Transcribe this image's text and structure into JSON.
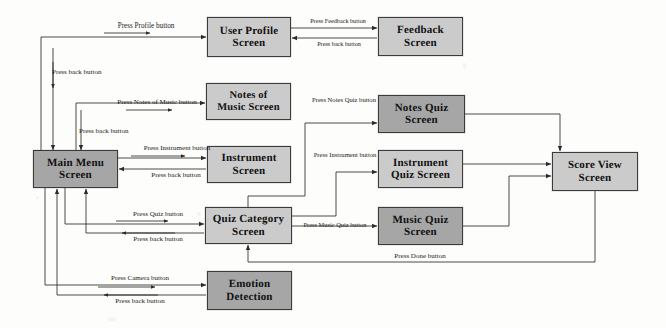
{
  "diagram": {
    "type": "flowchart",
    "canvas": {
      "width": 666,
      "height": 328
    },
    "colors": {
      "node_fill_light": "#cbcbcb",
      "node_fill_dark": "#a6a6a6",
      "node_border": "#3b3b3b",
      "arrow": "#2b2b2b",
      "background": "#fdfdfb",
      "text": "#111111"
    },
    "nodes": [
      {
        "id": "user_profile",
        "label_line1": "User Profile",
        "label_line2": "Screen",
        "x": 207,
        "y": 17,
        "w": 84,
        "h": 40,
        "fill": "light",
        "font_size": 11
      },
      {
        "id": "feedback",
        "label_line1": "Feedback",
        "label_line2": "Screen",
        "x": 378,
        "y": 17,
        "w": 85,
        "h": 39,
        "fill": "light",
        "font_size": 11
      },
      {
        "id": "notes_music",
        "label_line1": "Notes of",
        "label_line2": "Music Screen",
        "x": 206,
        "y": 83,
        "w": 85,
        "h": 37,
        "fill": "light",
        "font_size": 10.5
      },
      {
        "id": "notes_quiz",
        "label_line1": "Notes Quiz",
        "label_line2": "Screen",
        "x": 378,
        "y": 95,
        "w": 87,
        "h": 38,
        "fill": "dark",
        "font_size": 11
      },
      {
        "id": "main_menu",
        "label_line1": "Main Menu",
        "label_line2": "Screen",
        "x": 33,
        "y": 150,
        "w": 85,
        "h": 38,
        "fill": "dark",
        "font_size": 11
      },
      {
        "id": "instrument",
        "label_line1": "Instrument",
        "label_line2": "Screen",
        "x": 207,
        "y": 146,
        "w": 84,
        "h": 37,
        "fill": "light",
        "font_size": 11
      },
      {
        "id": "instrument_quiz",
        "label_line1": "Instrument",
        "label_line2": "Quiz Screen",
        "x": 378,
        "y": 150,
        "w": 85,
        "h": 38,
        "fill": "light",
        "font_size": 11
      },
      {
        "id": "score_view",
        "label_line1": "Score View",
        "label_line2": "Screen",
        "x": 552,
        "y": 152,
        "w": 86,
        "h": 39,
        "fill": "light",
        "font_size": 11
      },
      {
        "id": "quiz_category",
        "label_line1": "Quiz Category",
        "label_line2": "Screen",
        "x": 205,
        "y": 207,
        "w": 87,
        "h": 37,
        "fill": "light",
        "font_size": 11
      },
      {
        "id": "music_quiz",
        "label_line1": "Music Quiz",
        "label_line2": "Screen",
        "x": 378,
        "y": 207,
        "w": 85,
        "h": 38,
        "fill": "dark",
        "font_size": 11
      },
      {
        "id": "emotion",
        "label_line1": "Emotion",
        "label_line2": "Detection",
        "x": 207,
        "y": 271,
        "w": 85,
        "h": 39,
        "fill": "dark",
        "font_size": 11
      }
    ],
    "edge_labels": [
      {
        "id": "press_profile",
        "text": "Press Profile button",
        "x": 86,
        "y": 23,
        "w": 120,
        "align": "center",
        "font_size": 7.2
      },
      {
        "id": "press_feedback",
        "text": "Press Feedback button",
        "x": 296,
        "y": 18,
        "w": 84,
        "align": "center",
        "font_size": 6.2
      },
      {
        "id": "feedback_back",
        "text": "Press back button",
        "x": 300,
        "y": 41,
        "w": 78,
        "align": "center",
        "font_size": 6.2
      },
      {
        "id": "profile_back",
        "text": "Press back button",
        "x": 52,
        "y": 69,
        "w": 92,
        "align": "left",
        "font_size": 7
      },
      {
        "id": "press_notes_of_music",
        "text": "Press Notes of Music button",
        "x": 92,
        "y": 99,
        "w": 130,
        "align": "center",
        "font_size": 7
      },
      {
        "id": "notes_music_back",
        "text": "Press back button",
        "x": 79,
        "y": 128,
        "w": 92,
        "align": "left",
        "font_size": 7
      },
      {
        "id": "press_notes_quiz",
        "text": "Press Notes Quiz button",
        "x": 310,
        "y": 97,
        "w": 68,
        "align": "center",
        "font_size": 6.6,
        "two_line": true
      },
      {
        "id": "press_instrument",
        "text": "Press Instrument button",
        "x": 122,
        "y": 145,
        "w": 110,
        "align": "center",
        "font_size": 7
      },
      {
        "id": "instrument_back",
        "text": "Press back button",
        "x": 124,
        "y": 172,
        "w": 104,
        "align": "center",
        "font_size": 7
      },
      {
        "id": "press_instrument_quiz",
        "text": "Press Instrument button",
        "x": 312,
        "y": 152,
        "w": 66,
        "align": "center",
        "font_size": 6.6,
        "two_line": true
      },
      {
        "id": "press_quiz",
        "text": "Press Quiz button",
        "x": 110,
        "y": 211,
        "w": 96,
        "align": "center",
        "font_size": 7
      },
      {
        "id": "quiz_back",
        "text": "Press back button",
        "x": 110,
        "y": 236,
        "w": 96,
        "align": "center",
        "font_size": 7
      },
      {
        "id": "press_music_quiz",
        "text": "Press Music Quiz button",
        "x": 292,
        "y": 222,
        "w": 86,
        "align": "center",
        "font_size": 6.4
      },
      {
        "id": "press_camera",
        "text": "Press Camera button",
        "x": 84,
        "y": 275,
        "w": 112,
        "align": "center",
        "font_size": 7
      },
      {
        "id": "camera_back",
        "text": "Press back button",
        "x": 84,
        "y": 298,
        "w": 112,
        "align": "center",
        "font_size": 7
      },
      {
        "id": "press_done",
        "text": "Press Done button",
        "x": 370,
        "y": 253,
        "w": 100,
        "align": "center",
        "font_size": 7
      }
    ],
    "edges": [
      {
        "id": "main-to-profile",
        "from": "main_menu",
        "to": "user_profile",
        "label": "press_profile"
      },
      {
        "id": "profile-to-feedback",
        "from": "user_profile",
        "to": "feedback",
        "label": "press_feedback"
      },
      {
        "id": "feedback-to-profile",
        "from": "feedback",
        "to": "user_profile",
        "label": "feedback_back"
      },
      {
        "id": "profile-to-main",
        "from": "user_profile",
        "to": "main_menu",
        "label": "profile_back"
      },
      {
        "id": "main-to-notes-music",
        "from": "main_menu",
        "to": "notes_music",
        "label": "press_notes_of_music"
      },
      {
        "id": "notes-music-to-main",
        "from": "notes_music",
        "to": "main_menu",
        "label": "notes_music_back"
      },
      {
        "id": "main-to-instrument",
        "from": "main_menu",
        "to": "instrument",
        "label": "press_instrument"
      },
      {
        "id": "instrument-to-main",
        "from": "instrument",
        "to": "main_menu",
        "label": "instrument_back"
      },
      {
        "id": "main-to-quiz-category",
        "from": "main_menu",
        "to": "quiz_category",
        "label": "press_quiz"
      },
      {
        "id": "quiz-category-to-main",
        "from": "quiz_category",
        "to": "main_menu",
        "label": "quiz_back"
      },
      {
        "id": "quiz-to-notes-quiz",
        "from": "quiz_category",
        "to": "notes_quiz",
        "label": "press_notes_quiz"
      },
      {
        "id": "quiz-to-instr-quiz",
        "from": "quiz_category",
        "to": "instrument_quiz",
        "label": "press_instrument_quiz"
      },
      {
        "id": "quiz-to-music-quiz",
        "from": "quiz_category",
        "to": "music_quiz",
        "label": "press_music_quiz"
      },
      {
        "id": "notes-quiz-to-score",
        "from": "notes_quiz",
        "to": "score_view",
        "label": ""
      },
      {
        "id": "instr-quiz-to-score",
        "from": "instrument_quiz",
        "to": "score_view",
        "label": ""
      },
      {
        "id": "music-quiz-to-score",
        "from": "music_quiz",
        "to": "score_view",
        "label": ""
      },
      {
        "id": "score-to-quiz-category",
        "from": "score_view",
        "to": "quiz_category",
        "label": "press_done"
      },
      {
        "id": "main-to-emotion",
        "from": "main_menu",
        "to": "emotion",
        "label": "press_camera"
      },
      {
        "id": "emotion-to-main",
        "from": "emotion",
        "to": "main_menu",
        "label": "camera_back"
      }
    ]
  }
}
